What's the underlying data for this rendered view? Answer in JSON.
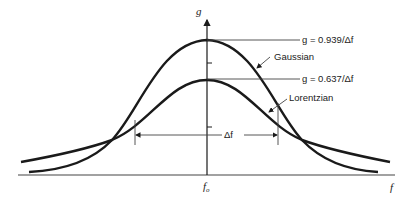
{
  "diagram": {
    "axis": {
      "y_label": "g",
      "x_label": "f",
      "center_label": "f",
      "center_sub": "o"
    },
    "curves": [
      {
        "name": "Gaussian",
        "peak_label": "g = 0.939/Δf"
      },
      {
        "name": "Lorentzian",
        "peak_label": "g = 0.637/Δf"
      }
    ],
    "width_marker": {
      "label": "Δf"
    },
    "colors": {
      "stroke": "#1a1a1a",
      "background": "#ffffff"
    }
  }
}
